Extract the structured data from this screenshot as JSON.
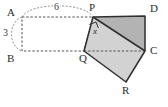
{
  "figure": {
    "background_color": "#ffffff",
    "width": 168,
    "height": 107,
    "stroke_color": "#2f2f2f",
    "dashed_color": "#555555",
    "fill_dark": "#b3b3b3",
    "fill_light": "#d2d2d2"
  },
  "vertices": [
    {
      "id": "A",
      "label": "A",
      "x": 22,
      "y": 17,
      "label_x": 8,
      "label_y": 8
    },
    {
      "id": "P",
      "label": "P",
      "x": 93,
      "y": 17,
      "label_x": 90,
      "label_y": 4
    },
    {
      "id": "D",
      "label": "D",
      "x": 145,
      "y": 16,
      "label_x": 150,
      "label_y": 5
    },
    {
      "id": "C",
      "label": "C",
      "x": 145,
      "y": 51,
      "label_x": 150,
      "label_y": 46
    },
    {
      "id": "R",
      "label": "R",
      "x": 126,
      "y": 82,
      "label_x": 122,
      "label_y": 85
    },
    {
      "id": "Q",
      "label": "Q",
      "x": 84,
      "y": 51,
      "label_x": 80,
      "label_y": 54
    },
    {
      "id": "B",
      "label": "B",
      "x": 22,
      "y": 51,
      "label_x": 8,
      "label_y": 54
    }
  ],
  "dimensions": [
    {
      "id": "top",
      "label": "6",
      "label_x": 54,
      "label_y": 3,
      "from": "A",
      "to": "P"
    },
    {
      "id": "left",
      "label": "3",
      "label_x": 3,
      "label_y": 29,
      "from": "A",
      "to": "B"
    }
  ],
  "angle": {
    "label": "x",
    "at_vertex": "P",
    "label_x": 97,
    "label_y": 28,
    "marker": "right-angle-square"
  },
  "shapes": {
    "dashed_rectangle": {
      "name": "APQB",
      "points": "22,17 93,17 84,51 22,51"
    },
    "shaded_triangle": {
      "name": "PDC",
      "points": "93,17 145,16 145,51",
      "fill": "#b3b3b3"
    },
    "shaded_quad": {
      "name": "PCRQ",
      "points": "93,17 145,51 126,82 84,51",
      "fill": "#d2d2d2"
    }
  }
}
